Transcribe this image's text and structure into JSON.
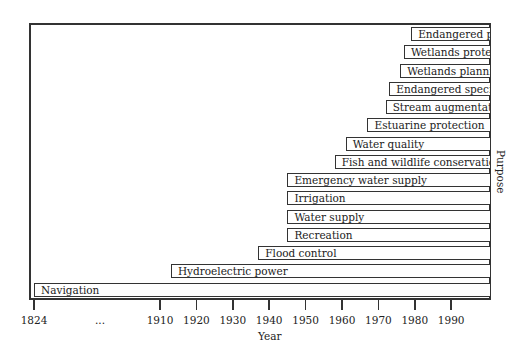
{
  "chart_data": {
    "type": "bar",
    "subtype": "horizontal-timeline",
    "title": "",
    "xlabel": "Year",
    "ylabel": "Purpose",
    "x_ticks": [
      "1824",
      "...",
      "1910",
      "1920",
      "1930",
      "1940",
      "1950",
      "1960",
      "1970",
      "1980",
      "1990"
    ],
    "x_end": 2000,
    "categories": [
      "Endangered plants",
      "Wetlands protect",
      "Wetlands planning",
      "Endangered species",
      "Stream augmentation",
      "Estuarine protection",
      "Water quality",
      "Fish and wildlife conservation",
      "Emergency water supply",
      "Irrigation",
      "Water supply",
      "Recreation",
      "Flood control",
      "Hydroelectric power",
      "Navigation"
    ],
    "start_years": [
      1979,
      1977,
      1976,
      1973,
      1972,
      1967,
      1961,
      1958,
      1945,
      1945,
      1945,
      1945,
      1937,
      1913,
      1824
    ],
    "end_year": 2000,
    "grid": false,
    "legend": null
  }
}
